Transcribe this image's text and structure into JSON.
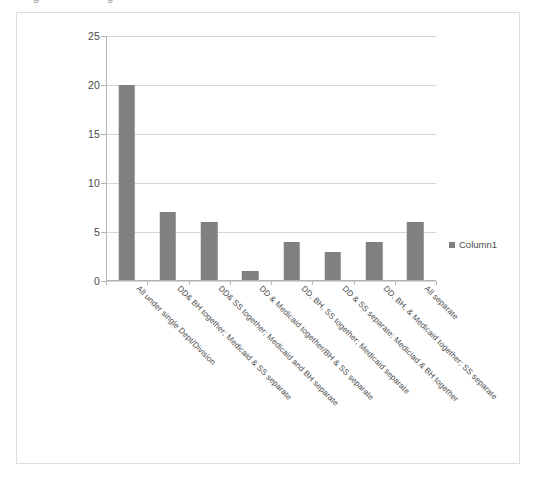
{
  "clipped_top_text": {
    "left_fragment": "g",
    "right_fragment": "g"
  },
  "legend": {
    "position": "right",
    "series_label": "Column1",
    "swatch_color": "#808080"
  },
  "colors": {
    "bar": "#808080",
    "gridline": "#d6d6d6",
    "axis": "#b4b4b4",
    "frame_border": "#dcdcdc",
    "background": "#ffffff",
    "text": "#4a4a4a"
  },
  "chart_data": {
    "type": "bar",
    "title": "",
    "subtitle": "",
    "xlabel": "",
    "ylabel": "",
    "ylim": [
      0,
      25
    ],
    "yticks": [
      0,
      5,
      10,
      15,
      20,
      25
    ],
    "grid": true,
    "legend_position": "right",
    "categories": [
      "All under single Dept/Division",
      "DD& BH together; Medicaid & SS separate",
      "DD& SS together; Medicaid and BH separate",
      "DD & Medicaid together/BH & SS separate",
      "DD, BH, SS together; Medicaid separate",
      "DD & SS separate; Mediciad & BH together",
      "DD, BH, & Medicaid together; SS separate",
      "All separate"
    ],
    "series": [
      {
        "name": "Column1",
        "values": [
          20,
          7,
          6,
          1,
          4,
          3,
          4,
          6
        ]
      }
    ]
  }
}
